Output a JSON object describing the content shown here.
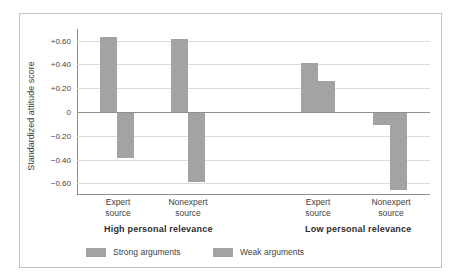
{
  "figure": {
    "ylabel": "Standardized attitude score"
  },
  "colors": {
    "bar": "#a3a3a3",
    "gridline": "#dcdcdc",
    "axis": "#8f8f8f",
    "frame_border": "#c4c4c4",
    "text": "#3f3f3f"
  },
  "chart_data": {
    "type": "bar",
    "title": "",
    "xlabel": "",
    "ylabel": "Standardized attitude score",
    "ylim": [
      -0.7,
      0.7
    ],
    "grid": true,
    "legend_position": "bottom",
    "yticks": [
      0.6,
      0.4,
      0.2,
      0,
      -0.2,
      -0.4,
      -0.6
    ],
    "ytick_labels": [
      "+0.60",
      "+0.40",
      "+0.20",
      "0",
      "−0.20",
      "−0.40",
      "−0.60"
    ],
    "groups": [
      {
        "label": "High personal relevance",
        "categories": [
          {
            "line1": "Expert",
            "line2": "source"
          },
          {
            "line1": "Nonexpert",
            "line2": "source"
          }
        ]
      },
      {
        "label": "Low personal relevance",
        "categories": [
          {
            "line1": "Expert",
            "line2": "source"
          },
          {
            "line1": "Nonexpert",
            "line2": "source"
          }
        ]
      }
    ],
    "categories": [
      "High relevance / Expert source",
      "High relevance / Nonexpert source",
      "Low relevance / Expert source",
      "Low relevance / Nonexpert source"
    ],
    "series": [
      {
        "name": "Strong arguments",
        "values": [
          0.63,
          0.61,
          0.41,
          -0.1
        ]
      },
      {
        "name": "Weak arguments",
        "values": [
          -0.38,
          -0.58,
          0.26,
          -0.65
        ]
      }
    ]
  }
}
